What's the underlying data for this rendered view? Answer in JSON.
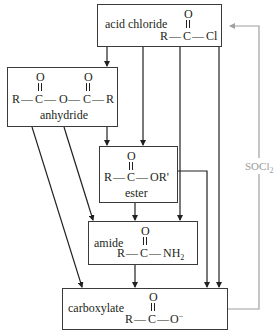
{
  "diagram": {
    "nodes": {
      "acid_chloride": {
        "label": "acid chloride",
        "formula": {
          "O": "O",
          "R": "R",
          "C": "C",
          "X": "Cl",
          "bond": "—"
        }
      },
      "anhydride": {
        "label": "anhydride",
        "formula": {
          "O1": "O",
          "O2": "O",
          "R1": "R",
          "C1": "C",
          "Omid": "O",
          "C2": "C",
          "R2": "R",
          "bond": "—"
        }
      },
      "ester": {
        "label": "ester",
        "formula": {
          "O": "O",
          "R": "R",
          "C": "C",
          "X": "OR'",
          "bond": "—"
        }
      },
      "amide": {
        "label": "amide",
        "formula": {
          "O": "O",
          "R": "R",
          "C": "C",
          "X": "NH",
          "X_sub": "2",
          "bond": "—"
        }
      },
      "carboxylate": {
        "label": "carboxylate",
        "formula": {
          "O": "O",
          "R": "R",
          "C": "C",
          "X": "O",
          "X_sup": "−",
          "bond": "—"
        }
      }
    },
    "edges": [
      {
        "from": "acid chloride",
        "to": "anhydride"
      },
      {
        "from": "acid chloride",
        "to": "ester"
      },
      {
        "from": "acid chloride",
        "to": "amide"
      },
      {
        "from": "acid chloride",
        "to": "carboxylate"
      },
      {
        "from": "anhydride",
        "to": "ester"
      },
      {
        "from": "anhydride",
        "to": "amide"
      },
      {
        "from": "anhydride",
        "to": "carboxylate"
      },
      {
        "from": "ester",
        "to": "amide"
      },
      {
        "from": "ester",
        "to": "carboxylate"
      },
      {
        "from": "amide",
        "to": "carboxylate"
      },
      {
        "from": "carboxylate",
        "to": "acid chloride",
        "reagent": "SOCl2"
      }
    ],
    "reagent": {
      "main": "SOCl",
      "sub": "2"
    },
    "colors": {
      "line": "#231f20",
      "reagent_line": "#a0a0a0"
    }
  }
}
